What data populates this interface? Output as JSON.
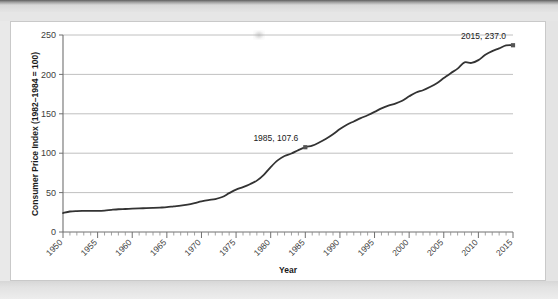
{
  "page": {
    "background_color": "#ffffff",
    "scan_band_color": "#e4e4e4"
  },
  "chart_data": {
    "type": "line",
    "title": "",
    "xlabel": "Year",
    "ylabel": "Consumer Price Index (1982–1984 = 100)",
    "xlim": [
      1950,
      2015
    ],
    "ylim": [
      0,
      250
    ],
    "yticks": [
      0,
      50,
      100,
      150,
      200,
      250
    ],
    "xticks": [
      1950,
      1955,
      1960,
      1965,
      1970,
      1975,
      1980,
      1985,
      1990,
      1995,
      2000,
      2005,
      2010,
      2015
    ],
    "xtick_labels": [
      "1950",
      "1955",
      "1960",
      "1965",
      "1970",
      "1975",
      "1980",
      "1985",
      "1990",
      "1995",
      "2000",
      "2005",
      "2010",
      "2015"
    ],
    "ytick_labels": [
      "0",
      "50",
      "100",
      "150",
      "200",
      "250"
    ],
    "grid": "horizontal",
    "legend": "none",
    "minor_xticks_interval": 1,
    "line_color": "#333333",
    "marker_color": "#555555",
    "x": [
      1950,
      1951,
      1952,
      1953,
      1954,
      1955,
      1956,
      1957,
      1958,
      1959,
      1960,
      1961,
      1962,
      1963,
      1964,
      1965,
      1966,
      1967,
      1968,
      1969,
      1970,
      1971,
      1972,
      1973,
      1974,
      1975,
      1976,
      1977,
      1978,
      1979,
      1980,
      1981,
      1982,
      1983,
      1984,
      1985,
      1986,
      1987,
      1988,
      1989,
      1990,
      1991,
      1992,
      1993,
      1994,
      1995,
      1996,
      1997,
      1998,
      1999,
      2000,
      2001,
      2002,
      2003,
      2004,
      2005,
      2006,
      2007,
      2008,
      2009,
      2010,
      2011,
      2012,
      2013,
      2014,
      2015
    ],
    "values": [
      24.1,
      26.0,
      26.6,
      26.8,
      26.9,
      26.8,
      27.2,
      28.1,
      28.9,
      29.2,
      29.6,
      29.9,
      30.3,
      30.6,
      31.0,
      31.5,
      32.5,
      33.4,
      34.8,
      36.7,
      38.8,
      40.5,
      41.8,
      44.4,
      49.3,
      53.8,
      56.9,
      60.6,
      65.2,
      72.6,
      82.4,
      90.9,
      96.5,
      99.6,
      103.9,
      107.6,
      109.6,
      113.6,
      118.3,
      124.0,
      130.7,
      136.2,
      140.3,
      144.5,
      148.2,
      152.4,
      156.9,
      160.5,
      163.0,
      166.6,
      172.2,
      177.1,
      179.9,
      184.0,
      188.9,
      195.3,
      201.6,
      207.3,
      215.3,
      214.5,
      218.1,
      224.9,
      229.6,
      233.0,
      236.7,
      237.0
    ],
    "annotations": [
      {
        "label": "1985, 107.6",
        "x": 1985,
        "y": 107.6,
        "marker": "square"
      },
      {
        "label": "2015, 237.0",
        "x": 2015,
        "y": 237.0,
        "marker": "square"
      }
    ]
  }
}
